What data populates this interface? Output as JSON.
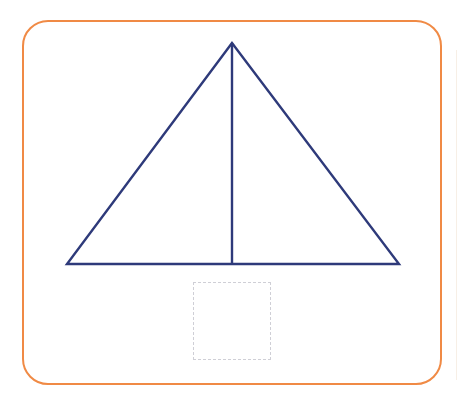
{
  "diagram": {
    "frame": {
      "border_color": "#f08a45",
      "corner_radius": 26
    },
    "triangle": {
      "stroke_color": "#2e3a7a",
      "apex": [
        232,
        43
      ],
      "base_left": [
        67,
        264
      ],
      "base_right": [
        399,
        264
      ],
      "divider_bottom": [
        232,
        264
      ]
    },
    "answer_box": {
      "style": "dashed",
      "border_color": "#cfcfd6",
      "content": ""
    }
  }
}
